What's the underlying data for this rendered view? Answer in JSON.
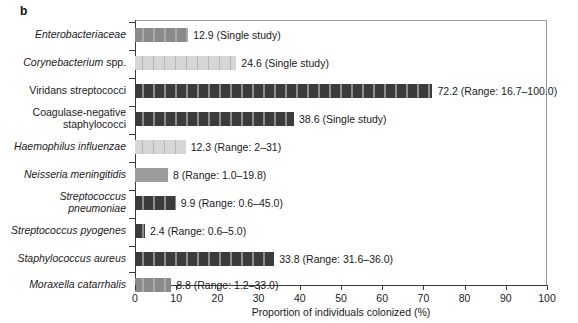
{
  "panel": {
    "letter": "b"
  },
  "chart_data": {
    "type": "bar",
    "orientation": "horizontal",
    "title": "",
    "xlabel": "Proportion of individuals colonized (%)",
    "ylabel": "",
    "xlim": [
      0,
      100
    ],
    "xticks": [
      0,
      10,
      20,
      30,
      40,
      50,
      60,
      70,
      80,
      90,
      100
    ],
    "xticklabels": [
      "0",
      "10",
      "20",
      "30",
      "40",
      "50",
      "60",
      "70",
      "80",
      "90",
      "100"
    ],
    "grid": false,
    "legend": null,
    "categories": [
      "Enterobacteriaceae",
      "Corynebacterium spp.",
      "Viridans streptococci",
      "Coagulase-negative staphylococci",
      "Haemophilus influenzae",
      "Neisseria meningitidis",
      "Streptococcus pneumoniae",
      "Streptococcus pyogenes",
      "Staphylococcus aureus",
      "Moraxella catarrhalis"
    ],
    "values": [
      12.9,
      24.6,
      72.2,
      38.6,
      12.3,
      8,
      9.9,
      2.4,
      33.8,
      8.8
    ],
    "annotations": [
      "12.9 (Single study)",
      "24.6 (Single study)",
      "72.2 (Range: 16.7–100.0)",
      "38.6 (Single study)",
      "12.3 (Range: 2–31)",
      "8 (Range: 1.0–19.8)",
      "9.9 (Range: 0.6–45.0)",
      "2.4 (Range: 0.6–5.0)",
      "33.8 (Range: 31.6–36.0)",
      "8.8 (Range: 1.2–33.0)"
    ]
  },
  "rows": [
    {
      "label": "Enterobacteriaceae",
      "label_italic": true,
      "label_lines": 1,
      "value": 12.9,
      "annotation": "12.9 (Single study)",
      "shade": "mid"
    },
    {
      "label": "Corynebacterium spp.",
      "label_italic": "partial",
      "label_html": "<i>Corynebacterium</i> spp.",
      "label_lines": 1,
      "value": 24.6,
      "annotation": "24.6 (Single study)",
      "shade": "light"
    },
    {
      "label": "Viridans streptococci",
      "label_italic": false,
      "label_lines": 1,
      "value": 72.2,
      "annotation": "72.2 (Range: 16.7–100.0)",
      "shade": "dark"
    },
    {
      "label": "Coagulase-negative\nstaphylococci",
      "label_italic": false,
      "label_lines": 2,
      "value": 38.6,
      "annotation": "38.6 (Single study)",
      "shade": "dark"
    },
    {
      "label": "Haemophilus influenzae",
      "label_italic": true,
      "label_lines": 1,
      "value": 12.3,
      "annotation": "12.3 (Range: 2–31)",
      "shade": "light"
    },
    {
      "label": "Neisseria meningitidis",
      "label_italic": true,
      "label_lines": 1,
      "value": 8,
      "annotation": "8 (Range: 1.0–19.8)",
      "shade": "plain-mid"
    },
    {
      "label": "Streptococcus\npneumoniae",
      "label_italic": true,
      "label_lines": 2,
      "value": 9.9,
      "annotation": "9.9 (Range: 0.6–45.0)",
      "shade": "dark"
    },
    {
      "label": "Streptococcus pyogenes",
      "label_italic": true,
      "label_lines": 1,
      "value": 2.4,
      "annotation": "2.4 (Range: 0.6–5.0)",
      "shade": "dark"
    },
    {
      "label": "Staphylococcus aureus",
      "label_italic": true,
      "label_lines": 1,
      "value": 33.8,
      "annotation": "33.8 (Range: 31.6–36.0)",
      "shade": "dark"
    },
    {
      "label": "Moraxella catarrhalis",
      "label_italic": true,
      "label_lines": 1,
      "value": 8.8,
      "annotation": "8.8 (Range: 1.2–33.0)",
      "shade": "mid"
    }
  ],
  "axis": {
    "title": "Proportion of individuals colonized (%)",
    "ticks": [
      "0",
      "10",
      "20",
      "30",
      "40",
      "50",
      "60",
      "70",
      "80",
      "90",
      "100"
    ]
  }
}
